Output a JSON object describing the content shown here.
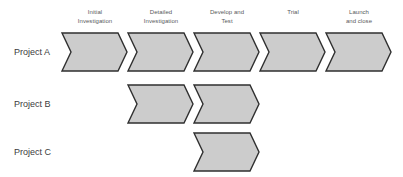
{
  "diagram": {
    "background_color": "#ffffff",
    "chevron_fill": "#cccccc",
    "chevron_stroke": "#2f2f2f",
    "header_text_color": "#58595b",
    "row_label_color": "#3c3c3c",
    "columns": [
      {
        "label": "Initial\nInvestigation",
        "x": 62
      },
      {
        "label": "Detailed\nInvestigation",
        "x": 128
      },
      {
        "label": "Develop and\nTest",
        "x": 194
      },
      {
        "label": "Trial",
        "x": 260
      },
      {
        "label": "Launch\nand close",
        "x": 326
      }
    ],
    "rows": [
      {
        "label": "Project A",
        "y": 33,
        "label_y": 47,
        "chevron_columns": [
          0,
          1,
          2,
          3,
          4
        ]
      },
      {
        "label": "Project B",
        "y": 85,
        "label_y": 99,
        "chevron_columns": [
          1,
          2
        ]
      },
      {
        "label": "Project C",
        "y": 133,
        "label_y": 147,
        "chevron_columns": [
          2
        ]
      }
    ]
  },
  "chart_data": {
    "type": "table",
    "xlabel": "Phase",
    "ylabel": "Project",
    "categories": [
      "Initial Investigation",
      "Detailed Investigation",
      "Develop and Test",
      "Trial",
      "Launch and close"
    ],
    "series": [
      {
        "name": "Project A",
        "values": [
          1,
          1,
          1,
          1,
          1
        ]
      },
      {
        "name": "Project B",
        "values": [
          0,
          1,
          1,
          0,
          0
        ]
      },
      {
        "name": "Project C",
        "values": [
          0,
          0,
          1,
          0,
          0
        ]
      }
    ],
    "legend": "none",
    "grid": false
  }
}
